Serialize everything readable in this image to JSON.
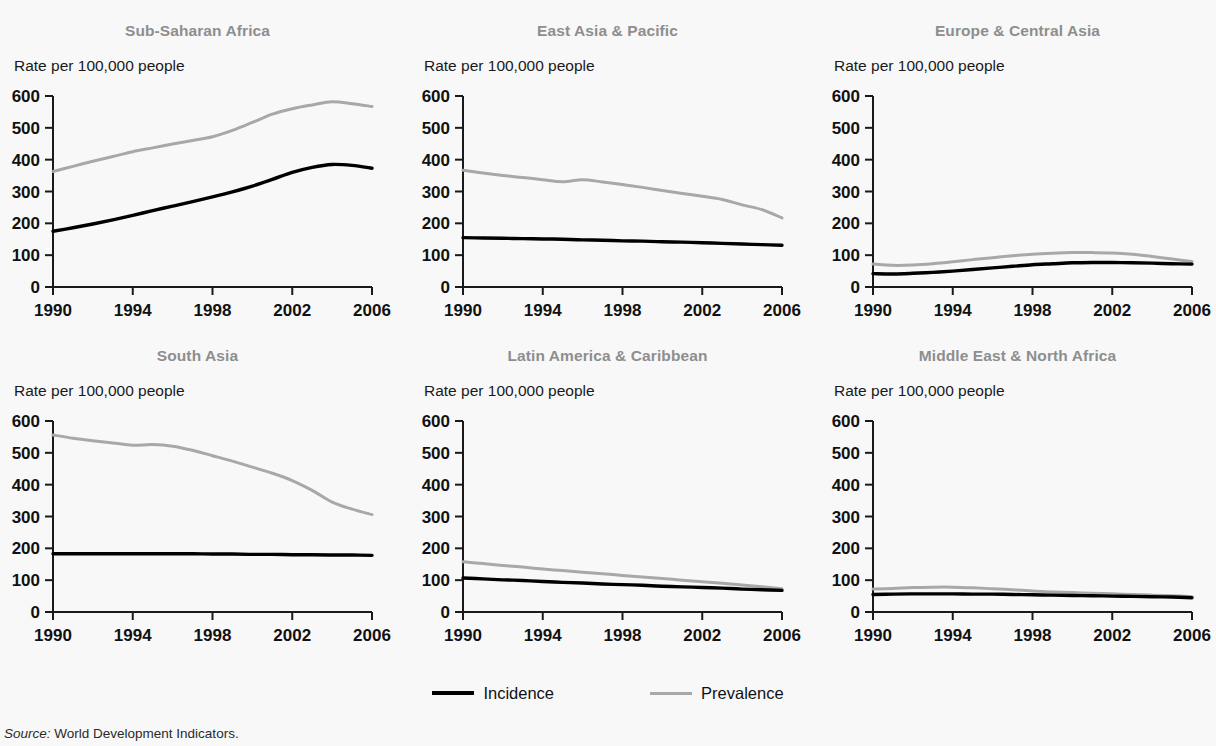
{
  "figure": {
    "background_color": "#f8f8f9",
    "title_color": "#8e8e8e",
    "incidence_color": "#000000",
    "prevalence_color": "#a8a8a8",
    "axis_label": "Rate per 100,000 people",
    "source_prefix": "Source:",
    "source_text": "World Development Indicators."
  },
  "legend": {
    "position": "bottom-center",
    "items": [
      {
        "label": "Incidence",
        "color": "#000000",
        "name": "incidence"
      },
      {
        "label": "Prevalence",
        "color": "#a8a8a8",
        "name": "prevalence"
      }
    ]
  },
  "chart_data": [
    {
      "type": "line",
      "title": "Sub-Saharan Africa",
      "xlabel": "",
      "ylabel": "Rate per 100,000 people",
      "ylim": [
        0,
        600
      ],
      "yticks": [
        0,
        100,
        200,
        300,
        400,
        500,
        600
      ],
      "xlim": [
        1990,
        2006
      ],
      "xticks": [
        1990,
        1994,
        1998,
        2002,
        2006
      ],
      "xtick_labels": [
        "1990",
        "1994",
        "1998",
        "2002",
        "2006"
      ],
      "grid": false,
      "x": [
        1990,
        1991,
        1992,
        1993,
        1994,
        1995,
        1996,
        1997,
        1998,
        1999,
        2000,
        2001,
        2002,
        2003,
        2004,
        2005,
        2006
      ],
      "series": [
        {
          "name": "Incidence",
          "color": "#000000",
          "values": [
            175,
            186,
            198,
            211,
            225,
            240,
            254,
            268,
            283,
            299,
            317,
            338,
            360,
            376,
            385,
            382,
            373
          ]
        },
        {
          "name": "Prevalence",
          "color": "#a8a8a8",
          "values": [
            363,
            379,
            395,
            410,
            425,
            437,
            449,
            460,
            472,
            492,
            517,
            543,
            560,
            572,
            582,
            576,
            567
          ]
        }
      ]
    },
    {
      "type": "line",
      "title": "East Asia & Pacific",
      "xlabel": "",
      "ylabel": "Rate per 100,000 people",
      "ylim": [
        0,
        600
      ],
      "yticks": [
        0,
        100,
        200,
        300,
        400,
        500,
        600
      ],
      "xlim": [
        1990,
        2006
      ],
      "xticks": [
        1990,
        1994,
        1998,
        2002,
        2006
      ],
      "xtick_labels": [
        "1990",
        "1994",
        "1998",
        "2002",
        "2006"
      ],
      "grid": false,
      "x": [
        1990,
        1991,
        1992,
        1993,
        1994,
        1995,
        1996,
        1997,
        1998,
        1999,
        2000,
        2001,
        2002,
        2003,
        2004,
        2005,
        2006
      ],
      "series": [
        {
          "name": "Incidence",
          "color": "#000000",
          "values": [
            155,
            154,
            153,
            152,
            151,
            150,
            148,
            147,
            145,
            144,
            142,
            141,
            139,
            137,
            135,
            133,
            131
          ]
        },
        {
          "name": "Prevalence",
          "color": "#a8a8a8",
          "values": [
            367,
            358,
            350,
            344,
            337,
            331,
            337,
            330,
            322,
            313,
            303,
            294,
            285,
            275,
            258,
            243,
            217
          ]
        }
      ]
    },
    {
      "type": "line",
      "title": "Europe & Central Asia",
      "xlabel": "",
      "ylabel": "Rate per 100,000 people",
      "ylim": [
        0,
        600
      ],
      "yticks": [
        0,
        100,
        200,
        300,
        400,
        500,
        600
      ],
      "xlim": [
        1990,
        2006
      ],
      "xticks": [
        1990,
        1994,
        1998,
        2002,
        2006
      ],
      "xtick_labels": [
        "1990",
        "1994",
        "1998",
        "2002",
        "2006"
      ],
      "grid": false,
      "x": [
        1990,
        1991,
        1992,
        1993,
        1994,
        1995,
        1996,
        1997,
        1998,
        1999,
        2000,
        2001,
        2002,
        2003,
        2004,
        2005,
        2006
      ],
      "series": [
        {
          "name": "Incidence",
          "color": "#000000",
          "values": [
            42,
            41,
            43,
            46,
            50,
            55,
            60,
            65,
            70,
            73,
            76,
            77,
            77,
            76,
            75,
            73,
            72
          ]
        },
        {
          "name": "Prevalence",
          "color": "#a8a8a8",
          "values": [
            72,
            68,
            69,
            73,
            79,
            86,
            92,
            98,
            103,
            106,
            108,
            108,
            107,
            103,
            96,
            88,
            80
          ]
        }
      ]
    },
    {
      "type": "line",
      "title": "South Asia",
      "xlabel": "",
      "ylabel": "Rate per 100,000 people",
      "ylim": [
        0,
        600
      ],
      "yticks": [
        0,
        100,
        200,
        300,
        400,
        500,
        600
      ],
      "xlim": [
        1990,
        2006
      ],
      "xticks": [
        1990,
        1994,
        1998,
        2002,
        2006
      ],
      "xtick_labels": [
        "1990",
        "1994",
        "1998",
        "2002",
        "2006"
      ],
      "grid": false,
      "x": [
        1990,
        1991,
        1992,
        1993,
        1994,
        1995,
        1996,
        1997,
        1998,
        1999,
        2000,
        2001,
        2002,
        2003,
        2004,
        2005,
        2006
      ],
      "series": [
        {
          "name": "Incidence",
          "color": "#000000",
          "values": [
            183,
            183,
            183,
            183,
            183,
            183,
            183,
            183,
            182,
            182,
            181,
            181,
            180,
            180,
            179,
            179,
            178
          ]
        },
        {
          "name": "Prevalence",
          "color": "#a8a8a8",
          "values": [
            556,
            546,
            538,
            531,
            524,
            526,
            521,
            508,
            491,
            474,
            455,
            436,
            413,
            382,
            345,
            323,
            306
          ]
        }
      ]
    },
    {
      "type": "line",
      "title": "Latin America & Caribbean",
      "xlabel": "",
      "ylabel": "Rate per 100,000 people",
      "ylim": [
        0,
        600
      ],
      "yticks": [
        0,
        100,
        200,
        300,
        400,
        500,
        600
      ],
      "xlim": [
        1990,
        2006
      ],
      "xticks": [
        1990,
        1994,
        1998,
        2002,
        2006
      ],
      "xtick_labels": [
        "1990",
        "1994",
        "1998",
        "2002",
        "2006"
      ],
      "grid": false,
      "x": [
        1990,
        1991,
        1992,
        1993,
        1994,
        1995,
        1996,
        1997,
        1998,
        1999,
        2000,
        2001,
        2002,
        2003,
        2004,
        2005,
        2006
      ],
      "series": [
        {
          "name": "Incidence",
          "color": "#000000",
          "values": [
            107,
            104,
            101,
            99,
            96,
            93,
            91,
            88,
            86,
            84,
            81,
            79,
            77,
            75,
            72,
            70,
            68
          ]
        },
        {
          "name": "Prevalence",
          "color": "#a8a8a8",
          "values": [
            158,
            152,
            146,
            141,
            135,
            130,
            125,
            120,
            115,
            110,
            105,
            100,
            95,
            90,
            85,
            79,
            73
          ]
        }
      ]
    },
    {
      "type": "line",
      "title": "Middle East & North Africa",
      "xlabel": "",
      "ylabel": "Rate per 100,000 people",
      "ylim": [
        0,
        600
      ],
      "yticks": [
        0,
        100,
        200,
        300,
        400,
        500,
        600
      ],
      "xlim": [
        1990,
        2006
      ],
      "xticks": [
        1990,
        1994,
        1998,
        2002,
        2006
      ],
      "xtick_labels": [
        "1990",
        "1994",
        "1998",
        "2002",
        "2006"
      ],
      "grid": false,
      "x": [
        1990,
        1991,
        1992,
        1993,
        1994,
        1995,
        1996,
        1997,
        1998,
        1999,
        2000,
        2001,
        2002,
        2003,
        2004,
        2005,
        2006
      ],
      "series": [
        {
          "name": "Incidence",
          "color": "#000000",
          "values": [
            55,
            56,
            57,
            57,
            57,
            56,
            56,
            55,
            54,
            53,
            52,
            51,
            50,
            49,
            48,
            47,
            45
          ]
        },
        {
          "name": "Prevalence",
          "color": "#a8a8a8",
          "values": [
            72,
            74,
            77,
            78,
            78,
            76,
            73,
            70,
            66,
            63,
            61,
            59,
            57,
            55,
            53,
            51,
            48
          ]
        }
      ]
    }
  ]
}
